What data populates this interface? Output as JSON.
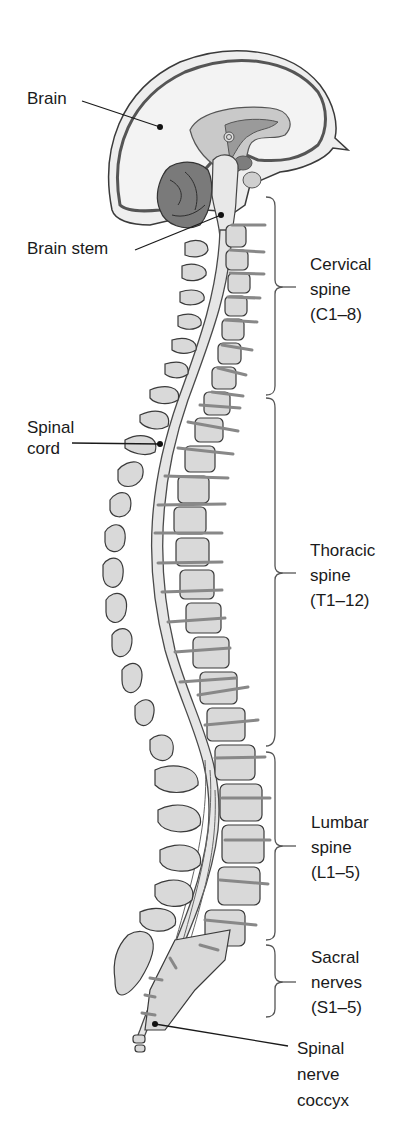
{
  "figure": {
    "colors": {
      "background": "#ffffff",
      "outline": "#3a3a3a",
      "bone_fill": "#d9d9d9",
      "brain_fill": "#eeeeee",
      "brain_dark": "#8a8a8a",
      "cord_fill": "#e6e6e6",
      "nerve_fill": "#c8c8c8",
      "text": "#1a1a1a"
    },
    "pointer_labels": [
      {
        "id": "brain",
        "text": "Brain"
      },
      {
        "id": "brain-stem",
        "text": "Brain stem"
      },
      {
        "id": "spinal-cord",
        "text": "Spinal\ncord"
      },
      {
        "id": "spinal-nerve-coccyx",
        "text": "Spinal\nnerve\ncoccyx"
      }
    ],
    "bracket_labels": [
      {
        "id": "cervical",
        "text": "Cervical\nspine\n(C1–8)"
      },
      {
        "id": "thoracic",
        "text": "Thoracic\nspine\n(T1–12)"
      },
      {
        "id": "lumbar",
        "text": "Lumbar\nspine\n(L1–5)"
      },
      {
        "id": "sacral",
        "text": "Sacral\nnerves\n(S1–5)"
      }
    ]
  }
}
